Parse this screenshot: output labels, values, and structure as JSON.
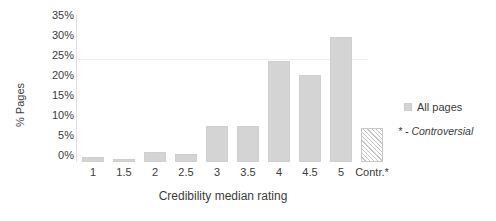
{
  "chart_data": {
    "type": "bar",
    "title": "",
    "xlabel": "Credibility median rating",
    "ylabel": "% Pages",
    "categories": [
      "1",
      "1.5",
      "2",
      "2.5",
      "3",
      "3.5",
      "4",
      "4.5",
      "5",
      "Contr.*"
    ],
    "values": [
      1.2,
      0.8,
      2.5,
      2.0,
      8.6,
      8.5,
      24.0,
      20.7,
      29.8,
      8.0
    ],
    "series": [
      {
        "name": "All pages",
        "values": [
          1.2,
          0.8,
          2.5,
          2.0,
          8.6,
          8.5,
          24.0,
          20.7,
          29.8,
          8.0
        ]
      }
    ],
    "ylim": [
      0,
      35
    ],
    "ytick_values": [
      0,
      5,
      10,
      15,
      20,
      25,
      30,
      35
    ],
    "ytick_labels": [
      "0%",
      "5%",
      "10%",
      "15%",
      "20%",
      "25%",
      "30%",
      "35%"
    ],
    "grid": true,
    "grid_axis": "y",
    "legend_position": "right",
    "legend_entries": [
      "All pages"
    ],
    "annotations": [
      "* - Controversial"
    ],
    "hatched_categories": [
      "Contr.*"
    ],
    "bar_color": "#d4d4d4",
    "bar_border_color": "#cfcfcf",
    "text_color": "#3c3c3c",
    "background_color": "#ffffff"
  },
  "axes": {
    "y_title": "% Pages",
    "x_title": "Credibility median rating"
  },
  "legend": {
    "swatch_name": "all-pages-swatch",
    "label": "All pages"
  },
  "footnote": {
    "text": "* - Controversial"
  }
}
